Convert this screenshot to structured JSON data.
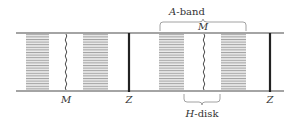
{
  "diagram": {
    "labels": {
      "a_band": "A-band",
      "a_band_prefix": "A",
      "a_band_suffix": "-band",
      "h_disk_prefix": "H",
      "h_disk_suffix": "-disk",
      "m_top": "M",
      "m_bottom_left": "M",
      "z_left": "Z",
      "z_right": "Z"
    },
    "colors": {
      "line": "#4a4a4a",
      "z_line": "#222222",
      "band_stripe": "#9a9a9a",
      "band_fill": "#e6e6e6",
      "text": "#333333"
    }
  }
}
